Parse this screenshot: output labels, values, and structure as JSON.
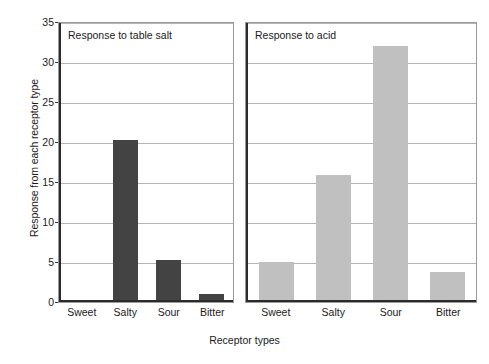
{
  "chart_data": {
    "type": "bar",
    "title": "",
    "xlabel": "Receptor types",
    "ylabel": "Response from each receptor type",
    "categories": [
      "Sweet",
      "Salty",
      "Sour",
      "Bitter"
    ],
    "ylim": [
      0,
      35
    ],
    "yticks": [
      0,
      5,
      10,
      15,
      20,
      25,
      30,
      35
    ],
    "ytick_labels": [
      "0",
      "5",
      "10",
      "15",
      "20",
      "25",
      "30",
      "35"
    ],
    "grid": true,
    "legend": "none",
    "panels": [
      {
        "title": "Response to table salt",
        "bar_color": "#434343",
        "values": [
          0,
          20,
          5,
          0.8
        ]
      },
      {
        "title": "Response to acid",
        "bar_color": "#c0c0c0",
        "values": [
          4.7,
          15.6,
          31.7,
          3.5
        ]
      }
    ],
    "series": [
      {
        "name": "Response to table salt",
        "values": [
          0,
          20,
          5,
          0.8
        ]
      },
      {
        "name": "Response to acid",
        "values": [
          4.7,
          15.6,
          31.7,
          3.5
        ]
      }
    ]
  }
}
